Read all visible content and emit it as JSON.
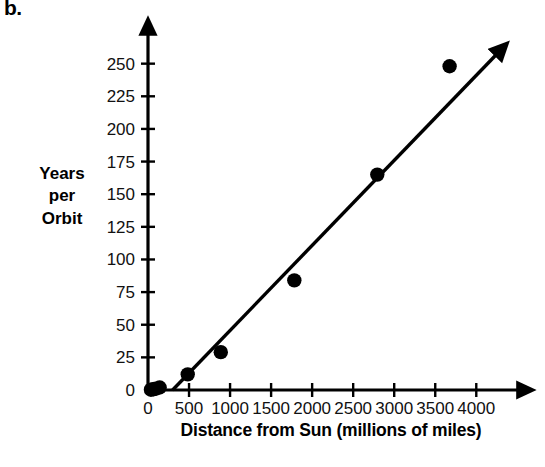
{
  "figure": {
    "part_label": "b.",
    "y_axis_title": "Years\nper\nOrbit",
    "x_axis_title": "Distance from Sun (millions of miles)"
  },
  "chart_data": {
    "type": "scatter",
    "title": "",
    "xlabel": "Distance from Sun (millions of miles)",
    "ylabel": "Years per Orbit",
    "xlim": [
      0,
      4350
    ],
    "ylim": [
      0,
      262
    ],
    "grid": false,
    "legend": null,
    "x_ticks": [
      0,
      500,
      1000,
      1500,
      2000,
      2500,
      3000,
      3500,
      4000
    ],
    "y_ticks": [
      0,
      25,
      50,
      75,
      100,
      125,
      150,
      175,
      200,
      225,
      250
    ],
    "x_tick_labels": [
      "0",
      "500",
      "1000",
      "1500",
      "2000",
      "2500",
      "3000",
      "3500",
      "4000"
    ],
    "y_tick_labels": [
      "0",
      "25",
      "50",
      "75",
      "100",
      "125",
      "150",
      "175",
      "200",
      "225",
      "250"
    ],
    "points": [
      {
        "x": 36,
        "y": 0.24
      },
      {
        "x": 67,
        "y": 0.62
      },
      {
        "x": 93,
        "y": 1.0
      },
      {
        "x": 142,
        "y": 1.9
      },
      {
        "x": 484,
        "y": 12
      },
      {
        "x": 887,
        "y": 29
      },
      {
        "x": 1783,
        "y": 84
      },
      {
        "x": 2794,
        "y": 165
      },
      {
        "x": 3675,
        "y": 248
      }
    ],
    "trend_line": {
      "label": "line of best fit",
      "x_start": 300,
      "y_start": 0,
      "x_end": 4260,
      "y_end": 258,
      "arrow_end": true
    },
    "axis_arrows": {
      "x": true,
      "y": true
    }
  }
}
